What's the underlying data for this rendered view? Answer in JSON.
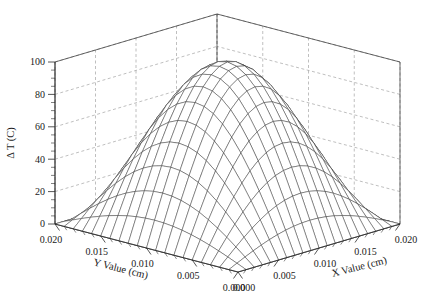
{
  "figure": {
    "kind": "3d-surface-mesh-plot",
    "background_color": "#ffffff",
    "line_color": "#2b2b2b",
    "grid_color": "#8a8a8a"
  },
  "axes": {
    "z": {
      "title": "Δ T (C)",
      "ticks": [
        "0",
        "20",
        "40",
        "60",
        "80",
        "100"
      ],
      "values": [
        0,
        20,
        40,
        60,
        80,
        100
      ],
      "range": [
        0,
        100
      ],
      "minor_ticks_per_major": 4
    },
    "y": {
      "title": "Y Value (cm)",
      "ticks": [
        "0.020",
        "0.015",
        "0.010",
        "0.005",
        "0.000"
      ],
      "values": [
        0.02,
        0.015,
        0.01,
        0.005,
        0.0
      ],
      "range": [
        0.0,
        0.02
      ]
    },
    "x": {
      "title": "X Value (cm)",
      "ticks": [
        "0.000",
        "0.005",
        "0.010",
        "0.015",
        "0.020"
      ],
      "values": [
        0.0,
        0.005,
        0.01,
        0.015,
        0.02
      ],
      "range": [
        0.0,
        0.02
      ]
    }
  },
  "chart_data": {
    "type": "surface",
    "title": "",
    "xlabel": "X Value (cm)",
    "ylabel": "Y Value (cm)",
    "zlabel": "Δ T (C)",
    "xlim": [
      0.0,
      0.02
    ],
    "ylim": [
      0.0,
      0.02
    ],
    "zlim": [
      0,
      100
    ],
    "xticks": [
      0.0,
      0.005,
      0.01,
      0.015,
      0.02
    ],
    "yticks": [
      0.0,
      0.005,
      0.01,
      0.015,
      0.02
    ],
    "zticks": [
      0,
      20,
      40,
      60,
      80,
      100
    ],
    "xticklabels": [
      "0.000",
      "0.005",
      "0.010",
      "0.015",
      "0.020"
    ],
    "yticklabels": [
      "0.020",
      "0.015",
      "0.010",
      "0.005",
      "0.000"
    ],
    "zticklabels": [
      "0",
      "20",
      "40",
      "60",
      "80",
      "100"
    ],
    "grid": true,
    "legend": "none",
    "mesh_nx": 21,
    "mesh_ny": 21,
    "surface_description": "Dome-shaped paraboloid: temperature rise peaks near the center of the domain and falls to zero at the x=0 and y=0 edges",
    "surface_formula": "z = 100 * sin(pi*x/0.02) * sin(pi*y/0.02)",
    "z_peak": 100,
    "z_min": 0,
    "peak_location": {
      "x": 0.01,
      "y": 0.01
    }
  },
  "view": {
    "elev_label": "default",
    "azim_label": "default",
    "box_aspect": "standard 3d box"
  }
}
